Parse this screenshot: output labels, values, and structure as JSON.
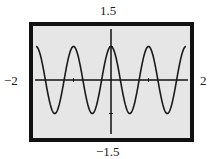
{
  "chart_data": {
    "type": "line",
    "title": "",
    "xlabel": "",
    "ylabel": "",
    "xlim": [
      -2,
      2
    ],
    "ylim": [
      -1.5,
      1.5
    ],
    "grid": false,
    "function": "y = cos(2πx)",
    "x_ticks": [
      -1,
      1
    ],
    "y_ticks": [
      -1,
      1
    ],
    "series": [
      {
        "name": "y = cos(2πx)",
        "x": [
          -2,
          -1.75,
          -1.5,
          -1.25,
          -1,
          -0.75,
          -0.5,
          -0.25,
          0,
          0.25,
          0.5,
          0.75,
          1,
          1.25,
          1.5,
          1.75,
          2
        ],
        "y": [
          1,
          0,
          -1,
          0,
          1,
          0,
          -1,
          0,
          1,
          0,
          -1,
          0,
          1,
          0,
          -1,
          0,
          1
        ]
      }
    ],
    "window_labels": {
      "ymax": "1.5",
      "ymin": "−1.5",
      "xmin": "−2",
      "xmax": "2"
    }
  },
  "colors": {
    "background": "#e6e6e6",
    "frame": "#111111",
    "curve": "#1a1a1a"
  }
}
